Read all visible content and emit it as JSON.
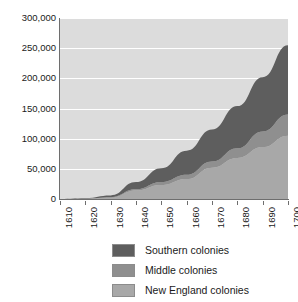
{
  "chart_data": {
    "type": "area",
    "stacked": true,
    "title": "",
    "subtitle": "",
    "xlabel": "",
    "ylabel": "",
    "x": [
      1610,
      1620,
      1630,
      1640,
      1650,
      1660,
      1670,
      1680,
      1690,
      1700
    ],
    "categories": [
      "1610",
      "1620",
      "1630",
      "1640",
      "1650",
      "1660",
      "1670",
      "1680",
      "1690",
      "1700"
    ],
    "xlim": [
      1610,
      1700
    ],
    "ylim": [
      0,
      300000
    ],
    "ytick_labels": [
      "0",
      "50,000",
      "100,000",
      "150,000",
      "200,000",
      "250,000",
      "300,000"
    ],
    "ytick_values": [
      0,
      50000,
      100000,
      150000,
      200000,
      250000,
      300000
    ],
    "grid": true,
    "legend_position": "bottom",
    "plot_background": "#dcdcdc",
    "gridline_color": "#ffffff",
    "series": [
      {
        "name": "New England colonies",
        "color": "#a8a8a8",
        "values": [
          0,
          500,
          2000,
          14000,
          23000,
          33000,
          52000,
          68000,
          86000,
          105000
        ]
      },
      {
        "name": "Middle colonies",
        "color": "#8f8f8f",
        "values": [
          0,
          300,
          1000,
          2000,
          5000,
          7000,
          10000,
          16000,
          26000,
          35000
        ]
      },
      {
        "name": "Southern colonies",
        "color": "#5e5e5e",
        "values": [
          200,
          1000,
          3000,
          12000,
          23000,
          40000,
          53000,
          70000,
          90000,
          115000
        ]
      }
    ],
    "stack_totals": [
      200,
      1800,
      6000,
      28000,
      51000,
      80000,
      115000,
      154000,
      202000,
      255000
    ]
  },
  "legend": {
    "items": [
      {
        "label": "Southern colonies",
        "color": "#5e5e5e"
      },
      {
        "label": "Middle colonies",
        "color": "#8f8f8f"
      },
      {
        "label": "New England colonies",
        "color": "#a8a8a8"
      }
    ]
  }
}
